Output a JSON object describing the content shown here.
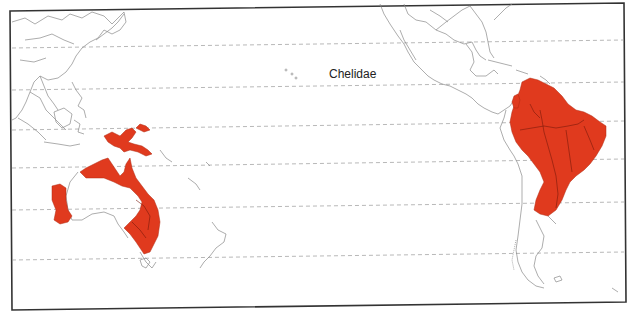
{
  "map": {
    "title": "Chelidae",
    "range_color": "#e03a1e",
    "land_outline_color": "#8a8a8a",
    "frame_color": "#333333",
    "graticule_color": "#9a9a9a",
    "projection_center": "Pacific Ocean",
    "regions_shaded": [
      "New Guinea",
      "Northern and Eastern Australia",
      "Southwestern Australia",
      "Northern South America",
      "Brazil to Northern Argentina"
    ],
    "regions_unshaded": [
      "East Asia",
      "Southeast Asia",
      "New Zealand",
      "North America",
      "Central America",
      "Southern Chile and Argentina"
    ],
    "graticule_lines": 6
  }
}
